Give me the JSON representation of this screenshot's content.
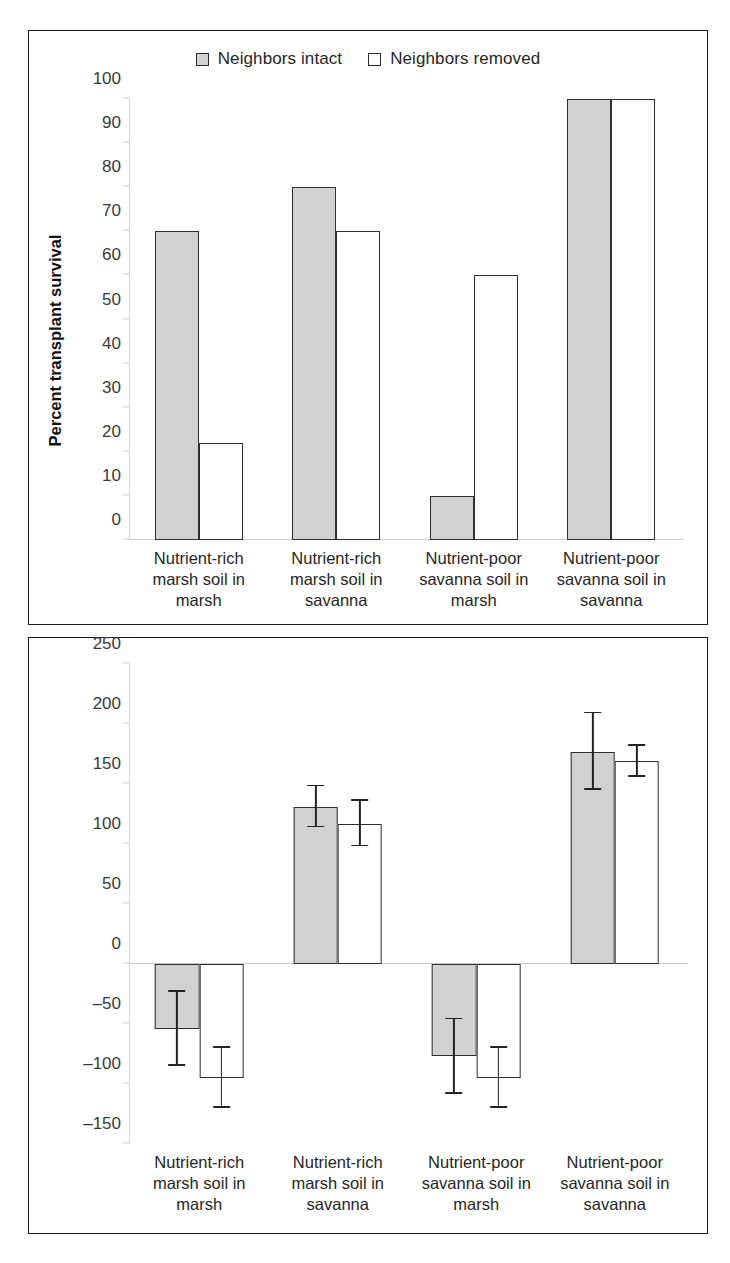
{
  "figure": {
    "background": "#ffffff",
    "series_colors": {
      "intact": "#d2d2d2",
      "removed": "#ffffff",
      "outline": "#2f2f2f"
    }
  },
  "legend": {
    "items": [
      {
        "label": "Neighbors intact",
        "swatch": "filled-square-icon"
      },
      {
        "label": "Neighbors removed",
        "swatch": "open-square-icon"
      }
    ]
  },
  "categories": [
    "Nutrient-rich\nmarsh soil in\nmarsh",
    "Nutrient-rich\nmarsh soil in\nsavanna",
    "Nutrient-poor\nsavanna soil in\nmarsh",
    "Nutrient-poor\nsavanna soil in\nsavanna"
  ],
  "chart_data": [
    {
      "type": "bar",
      "panel": "top",
      "title": "",
      "xlabel": "",
      "ylabel": "Percent transplant survival",
      "ylim": [
        0,
        100
      ],
      "yticks": [
        0,
        10,
        20,
        30,
        40,
        50,
        60,
        70,
        80,
        90,
        100
      ],
      "ytick_labels": [
        "0",
        "10",
        "20",
        "30",
        "40",
        "50",
        "60",
        "70",
        "80",
        "90",
        "100"
      ],
      "grid": false,
      "legend_position": "top-center",
      "categories": [
        "Nutrient-rich marsh soil in marsh",
        "Nutrient-rich marsh soil in savanna",
        "Nutrient-poor savanna soil in marsh",
        "Nutrient-poor savanna soil in savanna"
      ],
      "series": [
        {
          "name": "Neighbors intact",
          "values": [
            70,
            80,
            10,
            100
          ]
        },
        {
          "name": "Neighbors removed",
          "values": [
            22,
            70,
            60,
            100
          ]
        }
      ]
    },
    {
      "type": "bar",
      "panel": "bottom",
      "title": "",
      "xlabel": "",
      "ylabel": "Soil redox potential (mV)",
      "ylim": [
        -150,
        250
      ],
      "yticks": [
        -150,
        -100,
        -50,
        0,
        50,
        100,
        150,
        200,
        250
      ],
      "ytick_labels": [
        "–150",
        "–100",
        "–50",
        "0",
        "50",
        "100",
        "150",
        "200",
        "250"
      ],
      "grid": false,
      "legend_position": "none",
      "categories": [
        "Nutrient-rich marsh soil in marsh",
        "Nutrient-rich marsh soil in savanna",
        "Nutrient-poor savanna soil in marsh",
        "Nutrient-poor savanna soil in savanna"
      ],
      "series": [
        {
          "name": "Neighbors intact",
          "values": [
            -54,
            131,
            -77,
            177
          ],
          "errors": [
            31,
            17,
            31,
            32
          ]
        },
        {
          "name": "Neighbors removed",
          "values": [
            -95,
            117,
            -95,
            169
          ],
          "errors": [
            25,
            19,
            25,
            13
          ]
        }
      ]
    }
  ]
}
